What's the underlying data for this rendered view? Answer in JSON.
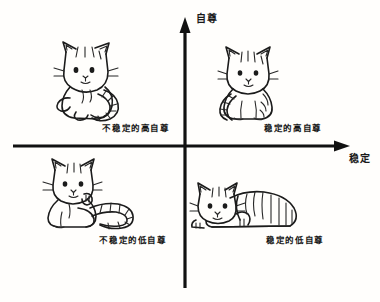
{
  "diagram": {
    "title_text": "",
    "background_color": "#fffefc",
    "ink_color": "#1b1b1b",
    "axes": {
      "y_axis_label": "自尊",
      "x_axis_label": "稳定",
      "origin": {
        "x": 185,
        "y": 146
      },
      "y_top": 20,
      "y_bottom": 288,
      "x_left": 13,
      "x_right": 348
    },
    "quadrants": [
      {
        "id": "unstable-high",
        "label": "不稳定的高自尊",
        "position": "top-left",
        "cat_pose": "sitting cat with raised paw and curled striped tail"
      },
      {
        "id": "stable-high",
        "label": "稳定的高自尊",
        "position": "top-right",
        "cat_pose": "upright sitting cat facing forward"
      },
      {
        "id": "unstable-low",
        "label": "不稳定的低自尊",
        "position": "bottom-left",
        "cat_pose": "sitting cat with long striped tail stretched out"
      },
      {
        "id": "stable-low",
        "label": "稳定的低自尊",
        "position": "bottom-right",
        "cat_pose": "cat lying down in loaf position with striped body"
      }
    ]
  }
}
